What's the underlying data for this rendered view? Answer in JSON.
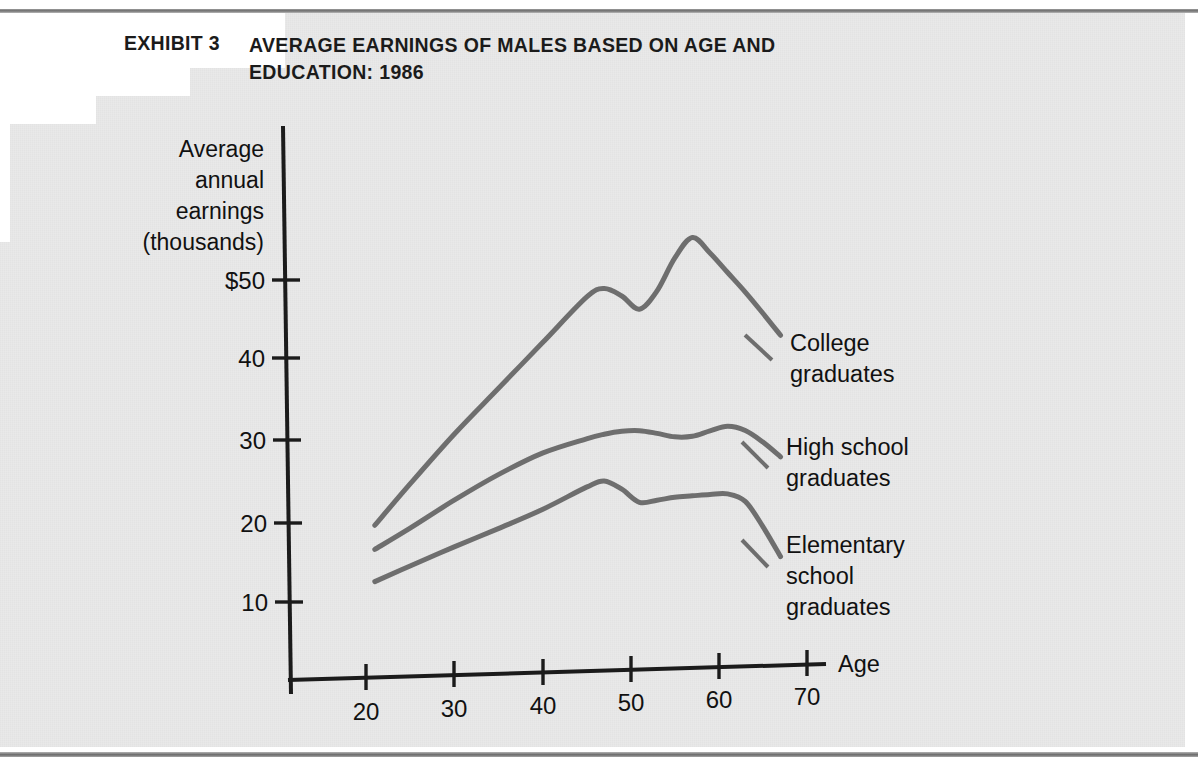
{
  "exhibit": {
    "label": "EXHIBIT 3",
    "title_lines": [
      "AVERAGE EARNINGS OF MALES BASED ON AGE AND",
      "EDUCATION: 1986"
    ]
  },
  "axes": {
    "y_label_lines": [
      "Average",
      "annual",
      "earnings",
      "(thousands)"
    ],
    "y_ticks": [
      "$50",
      "40",
      "30",
      "20",
      "10"
    ],
    "x_ticks": [
      "20",
      "30",
      "40",
      "50",
      "60",
      "70"
    ],
    "x_axis_name": "Age"
  },
  "series_labels": [
    {
      "lines": [
        "College",
        "graduates"
      ]
    },
    {
      "lines": [
        "High school",
        "graduates"
      ]
    },
    {
      "lines": [
        "Elementary",
        "school",
        "graduates"
      ]
    }
  ],
  "colors": {
    "paper": "#e9e9e9",
    "ink": "#111111",
    "curve": "#6e6e6e",
    "axis": "#1b1b1b"
  },
  "chart_data": {
    "type": "line",
    "title": "AVERAGE EARNINGS OF MALES BASED ON AGE AND EDUCATION: 1986",
    "subtitle": "EXHIBIT 3",
    "xlabel": "Age",
    "ylabel": "Average annual earnings (thousands)",
    "xlim": [
      14,
      74
    ],
    "ylim": [
      0,
      58
    ],
    "xticks": [
      20,
      30,
      40,
      50,
      60,
      70
    ],
    "yticks": [
      10,
      20,
      30,
      40,
      50
    ],
    "ytick_labels": [
      "10",
      "20",
      "30",
      "40",
      "$50"
    ],
    "grid": false,
    "legend": "inline-right-of-curves",
    "units": "thousands of dollars per year",
    "series": [
      {
        "name": "College graduates",
        "x": [
          21,
          25,
          30,
          35,
          40,
          45,
          47,
          49,
          51,
          53,
          55,
          57,
          59,
          61,
          63,
          65,
          67
        ],
        "values": [
          19.5,
          24.5,
          30.5,
          36.0,
          41.5,
          47.0,
          48.0,
          47.0,
          45.3,
          47.5,
          51.5,
          54.0,
          52.0,
          49.5,
          47.0,
          44.3,
          41.5
        ]
      },
      {
        "name": "High school graduates",
        "x": [
          21,
          25,
          30,
          35,
          40,
          45,
          47,
          49,
          51,
          53,
          55,
          57,
          59,
          61,
          63,
          65,
          67
        ],
        "values": [
          16.5,
          19.0,
          22.3,
          25.3,
          27.8,
          29.4,
          29.9,
          30.2,
          30.2,
          29.8,
          29.3,
          29.3,
          29.9,
          30.4,
          29.8,
          28.3,
          26.4
        ]
      },
      {
        "name": "Elementary school graduates",
        "x": [
          21,
          25,
          30,
          35,
          40,
          45,
          47,
          49,
          51,
          53,
          55,
          57,
          59,
          61,
          63,
          65,
          67
        ],
        "values": [
          12.5,
          14.3,
          16.5,
          18.6,
          20.8,
          23.4,
          24.1,
          23.0,
          21.3,
          21.5,
          21.8,
          21.9,
          22.0,
          22.0,
          21.0,
          17.8,
          14.0
        ]
      }
    ]
  }
}
